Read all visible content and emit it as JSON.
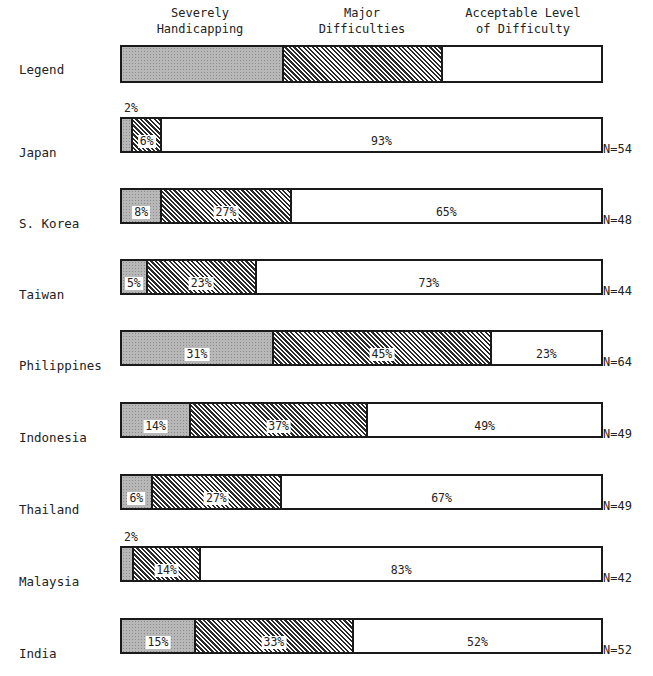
{
  "chart_data": {
    "type": "bar",
    "orientation": "horizontal-stacked-100",
    "title": "",
    "legend_label": "Legend",
    "series": [
      {
        "name": "Severely Handicapping",
        "pattern": "stippled-gray",
        "values": [
          2,
          8,
          5,
          31,
          14,
          6,
          2,
          15
        ]
      },
      {
        "name": "Major Difficulties",
        "pattern": "diagonal-hatch",
        "values": [
          6,
          27,
          23,
          45,
          37,
          27,
          14,
          33
        ]
      },
      {
        "name": "Acceptable Level of Difficulty",
        "pattern": "white",
        "values": [
          93,
          65,
          73,
          23,
          49,
          67,
          83,
          52
        ]
      }
    ],
    "categories": [
      "Japan",
      "S. Korea",
      "Taiwan",
      "Philippines",
      "Indonesia",
      "Thailand",
      "Malaysia",
      "India"
    ],
    "n": [
      "N=54",
      "N=48",
      "N=44",
      "N=64",
      "N=49",
      "N=49",
      "N=42",
      "N=52"
    ],
    "xlim": [
      0,
      100
    ],
    "grid": false,
    "legend_position": "top"
  },
  "legend": {
    "label": "Legend",
    "headers": [
      "Severely\nHandicapping",
      "Major\nDifficulties",
      "Acceptable Level\nof Difficulty"
    ]
  },
  "rows": [
    {
      "label": "Japan",
      "severe": "2%",
      "major": "6%",
      "accept": "93%",
      "n": "N=54"
    },
    {
      "label": "S. Korea",
      "severe": "8%",
      "major": "27%",
      "accept": "65%",
      "n": "N=48"
    },
    {
      "label": "Taiwan",
      "severe": "5%",
      "major": "23%",
      "accept": "73%",
      "n": "N=44"
    },
    {
      "label": "Philippines",
      "severe": "31%",
      "major": "45%",
      "accept": "23%",
      "n": "N=64"
    },
    {
      "label": "Indonesia",
      "severe": "14%",
      "major": "37%",
      "accept": "49%",
      "n": "N=49"
    },
    {
      "label": "Thailand",
      "severe": "6%",
      "major": "27%",
      "accept": "67%",
      "n": "N=49"
    },
    {
      "label": "Malaysia",
      "severe": "2%",
      "major": "14%",
      "accept": "83%",
      "n": "N=42"
    },
    {
      "label": "India",
      "severe": "15%",
      "major": "33%",
      "accept": "52%",
      "n": "N=52"
    }
  ]
}
